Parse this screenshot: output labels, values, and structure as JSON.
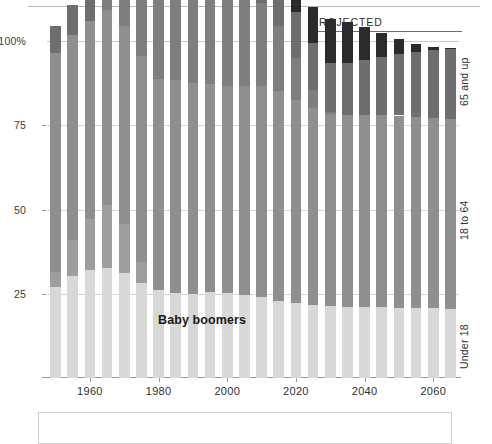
{
  "annotations": {
    "projected_label": "PROJECTED",
    "boomer_label": "Baby boomers"
  },
  "right_labels": [
    {
      "name": "65-and-up",
      "text": "65 and up"
    },
    {
      "name": "18-to-64",
      "text": "18 to 64"
    },
    {
      "name": "under-18",
      "text": "Under 18"
    }
  ],
  "colors": {
    "under18": "#d8d8d8",
    "adult": "#8f8f8f",
    "senior": "#6e6e6e",
    "boomer": "#7e7e7e",
    "boomer_senior": "#2b2b2b",
    "boomer_child": "#9e9e9e",
    "gridline": "#d7d7d7",
    "axis": "#9a9a9a"
  },
  "chart_data": {
    "type": "bar",
    "subtype": "100% stacked bar with highlighted cohort band",
    "title": "",
    "subtitle": "",
    "xlabel": "",
    "ylabel": "",
    "ylim": [
      0,
      100
    ],
    "yticks": [
      25,
      50,
      75,
      100
    ],
    "ytick_labels": [
      "25",
      "50",
      "75",
      "100%"
    ],
    "grid": true,
    "legend_position": "right-rotated",
    "xticks": [
      1960,
      1980,
      2000,
      2020,
      2040,
      2060
    ],
    "xtick_labels": [
      "1960",
      "1980",
      "2000",
      "2020",
      "2040",
      "2060"
    ],
    "projected_from": 2015,
    "categories": [
      1950,
      1955,
      1960,
      1965,
      1970,
      1975,
      1980,
      1985,
      1990,
      1995,
      2000,
      2005,
      2010,
      2015,
      2020,
      2025,
      2030,
      2035,
      2040,
      2045,
      2050,
      2055,
      2060,
      2065
    ],
    "series": [
      {
        "name": "Under 18",
        "key": "under18",
        "color": "#d8d8d8",
        "values": [
          26.9,
          30.3,
          32.0,
          32.7,
          31.2,
          28.1,
          26.0,
          25.3,
          25.0,
          25.4,
          25.2,
          24.7,
          23.9,
          22.9,
          22.3,
          21.8,
          21.4,
          21.2,
          21.1,
          21.0,
          20.9,
          20.8,
          20.7,
          20.6
        ]
      },
      {
        "name": "Baby boomers (as children, under 18)",
        "key": "boomer_child",
        "color": "#9e9e9e",
        "values": [
          4.5,
          10.8,
          15.2,
          18.6,
          14.4,
          6.2,
          0,
          0,
          0,
          0,
          0,
          0,
          0,
          0,
          0,
          0,
          0,
          0,
          0,
          0,
          0,
          0,
          0,
          0
        ]
      },
      {
        "name": "18 to 64",
        "key": "adult",
        "color": "#8f8f8f",
        "values": [
          64.9,
          60.6,
          58.8,
          58.0,
          59.0,
          61.2,
          62.6,
          63.0,
          62.5,
          61.9,
          61.4,
          61.9,
          62.8,
          62.3,
          60.1,
          58.2,
          56.8,
          56.7,
          57.0,
          57.1,
          57.0,
          56.8,
          56.6,
          56.4
        ]
      },
      {
        "name": "Baby boomers (working age, 18-64)",
        "key": "boomer",
        "color": "#7e7e7e",
        "values": [
          0,
          0,
          0,
          2.8,
          10.9,
          19.0,
          25.8,
          28.8,
          29.6,
          29.4,
          28.7,
          27.2,
          24.6,
          19.4,
          12.5,
          5.4,
          0.6,
          0,
          0,
          0,
          0,
          0,
          0,
          0
        ]
      },
      {
        "name": "65 and up",
        "key": "senior",
        "color": "#6e6e6e",
        "values": [
          8.2,
          9.1,
          9.2,
          9.3,
          9.8,
          10.7,
          11.4,
          11.7,
          12.5,
          12.7,
          12.4,
          12.4,
          13.1,
          13.1,
          13.6,
          13.9,
          14.6,
          15.5,
          16.4,
          17.3,
          18.2,
          19.1,
          20.0,
          20.8
        ]
      },
      {
        "name": "Baby boomers (65 and up)",
        "key": "boomer_senior",
        "color": "#2b2b2b",
        "values": [
          0,
          0,
          0,
          0,
          0,
          0,
          0,
          0,
          0,
          0,
          0,
          0,
          0,
          2.3,
          6.5,
          10.7,
          13.2,
          12.1,
          9.6,
          7.0,
          4.4,
          2.3,
          0.9,
          0.2
        ]
      }
    ],
    "stack_order": [
      "under18",
      "boomer_child",
      "adult",
      "boomer",
      "senior",
      "boomer_senior"
    ]
  }
}
